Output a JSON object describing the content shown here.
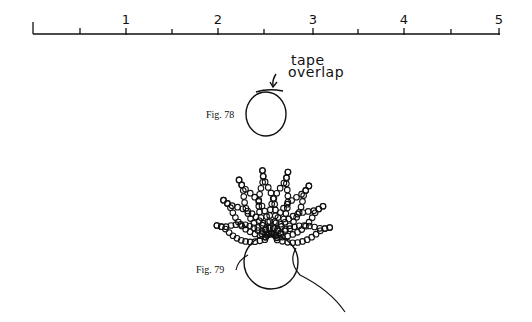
{
  "ruler": {
    "unit_labels": [
      "1",
      "2",
      "3",
      "4",
      "5"
    ],
    "label_x": [
      126,
      218,
      313,
      404,
      499
    ]
  },
  "figures": {
    "fig78": {
      "label": "Fig. 78",
      "annotation_line1": "tape",
      "annotation_line2": "overlap"
    },
    "fig79": {
      "label": "Fig. 79"
    }
  }
}
